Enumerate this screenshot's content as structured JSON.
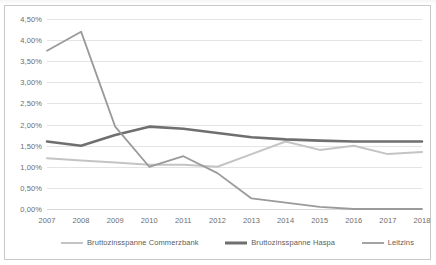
{
  "chart_data": {
    "type": "line",
    "title": "",
    "xlabel": "",
    "ylabel": "",
    "categories": [
      "2007",
      "2008",
      "2009",
      "2010",
      "2011",
      "2012",
      "2013",
      "2014",
      "2015",
      "2016",
      "2017",
      "2018"
    ],
    "ylim": [
      0.0,
      4.5
    ],
    "ytick_step": 0.5,
    "ytick_labels": [
      "0,00%",
      "0,50%",
      "1,00%",
      "1,50%",
      "2,00%",
      "2,50%",
      "3,00%",
      "3,50%",
      "4,00%",
      "4,50%"
    ],
    "ytick_values": [
      0.0,
      0.5,
      1.0,
      1.5,
      2.0,
      2.5,
      3.0,
      3.5,
      4.0,
      4.5
    ],
    "grid": true,
    "grid_axis": "y",
    "legend_position": "bottom",
    "value_unit": "%",
    "decimal_separator": ",",
    "series": [
      {
        "name": "Bruttozinsspanne Commerzbank",
        "color": "#c4c4c4",
        "width": 2.0,
        "values": [
          1.2,
          1.15,
          1.1,
          1.05,
          1.05,
          1.0,
          1.3,
          1.6,
          1.4,
          1.5,
          1.3,
          1.35
        ]
      },
      {
        "name": "Bruttozinsspanne Haspa",
        "color": "#6f6f6f",
        "width": 2.6,
        "values": [
          1.6,
          1.5,
          1.75,
          1.95,
          1.9,
          1.8,
          1.7,
          1.65,
          1.62,
          1.6,
          1.6,
          1.6
        ]
      },
      {
        "name": "Leitzins",
        "color": "#9a9a9a",
        "width": 1.8,
        "values": [
          3.75,
          4.2,
          1.95,
          1.0,
          1.25,
          0.85,
          0.25,
          0.15,
          0.05,
          0.0,
          0.0,
          0.0
        ]
      }
    ]
  },
  "legend": {
    "items": [
      {
        "label": "Bruttozinsspanne Commerzbank",
        "color": "#c4c4c4",
        "width": 2.0
      },
      {
        "label": "Bruttozinsspanne Haspa",
        "color": "#6f6f6f",
        "width": 3.0
      },
      {
        "label": "Leitzins",
        "color": "#9a9a9a",
        "width": 1.8
      }
    ]
  }
}
